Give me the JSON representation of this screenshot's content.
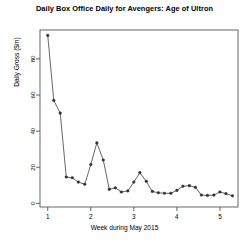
{
  "chart_data": {
    "type": "line",
    "title": "Daily Box Office Daily for Avengers: Age of Ultron",
    "xlabel": "Week during May 2015",
    "ylabel": "Daily Gross ($m)",
    "grid": false,
    "legend": "none",
    "marker": "filled-circle",
    "line_color": "#4d4d4d",
    "marker_color": "#333333",
    "axis_color": "#555555",
    "background": "#ffffff",
    "xlim": [
      0.82,
      5.42
    ],
    "ylim": [
      -2.0,
      96.0
    ],
    "xticks": [
      1,
      2,
      3,
      4,
      5
    ],
    "xtick_labels": [
      "1",
      "2",
      "3",
      "4",
      "5"
    ],
    "yticks": [
      0,
      20,
      40,
      60,
      80
    ],
    "ytick_labels": [
      "0",
      "20",
      "40",
      "60",
      "80"
    ],
    "x": [
      1.0,
      1.14,
      1.29,
      1.43,
      1.57,
      1.71,
      1.86,
      2.0,
      2.14,
      2.29,
      2.43,
      2.57,
      2.71,
      2.86,
      3.0,
      3.14,
      3.29,
      3.43,
      3.57,
      3.71,
      3.86,
      4.0,
      4.14,
      4.29,
      4.43,
      4.57,
      4.71,
      4.86,
      5.0,
      5.14,
      5.29
    ],
    "values": [
      93.0,
      57.0,
      50.0,
      14.6,
      14.2,
      11.8,
      10.6,
      21.5,
      33.5,
      24.0,
      7.8,
      8.6,
      6.3,
      6.9,
      11.8,
      17.0,
      12.2,
      6.6,
      5.9,
      5.6,
      5.6,
      7.2,
      9.5,
      9.8,
      8.9,
      4.6,
      4.4,
      4.6,
      6.3,
      5.4,
      4.2
    ],
    "series_name": "Daily Gross"
  }
}
